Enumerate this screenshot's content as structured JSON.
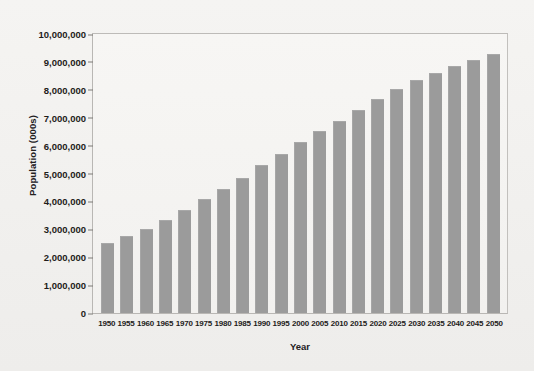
{
  "chart_data": {
    "type": "bar",
    "title": "",
    "xlabel": "Year",
    "ylabel": "Population (000s)",
    "categories": [
      "1950",
      "1955",
      "1960",
      "1965",
      "1970",
      "1975",
      "1980",
      "1985",
      "1990",
      "1995",
      "2000",
      "2005",
      "2010",
      "2015",
      "2020",
      "2025",
      "2030",
      "2035",
      "2040",
      "2045",
      "2050"
    ],
    "values": [
      2520000,
      2770000,
      3020000,
      3340000,
      3700000,
      4080000,
      4450000,
      4850000,
      5290000,
      5690000,
      6120000,
      6510000,
      6900000,
      7280000,
      7660000,
      8030000,
      8340000,
      8620000,
      8870000,
      9070000,
      9270000
    ],
    "ylim": [
      0,
      10000000
    ],
    "ytick_labels": [
      "10,000,000",
      "9,000,000",
      "8,000,000",
      "7,000,000",
      "6,000,000",
      "5,000,000",
      "4,000,000",
      "3,000,000",
      "2,000,000",
      "1,000,000",
      "0"
    ],
    "ytick_values": [
      10000000,
      9000000,
      8000000,
      7000000,
      6000000,
      5000000,
      4000000,
      3000000,
      2000000,
      1000000,
      0
    ],
    "grid": false,
    "legend": null,
    "bar_color": "#9b9b9b",
    "plot_background": "#f2f1ef",
    "figure_background": "#f3f2f0",
    "axis_color": "#b9b7b4"
  }
}
